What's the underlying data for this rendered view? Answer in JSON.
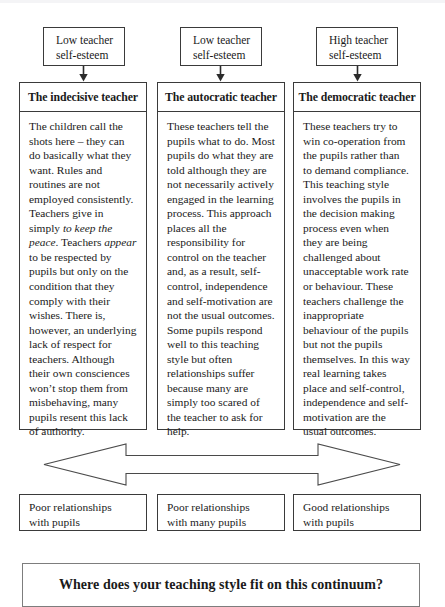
{
  "diagram": {
    "title_banner": "Where does your teaching style fit on this continuum?",
    "esteem_boxes": [
      {
        "line1": "Low teacher",
        "line2": "self-esteem"
      },
      {
        "line1": "Low teacher",
        "line2": "self-esteem"
      },
      {
        "line1": "High teacher",
        "line2": "self-esteem"
      }
    ],
    "columns": [
      {
        "title": "The indecisive teacher",
        "body_html": "The children call the shots here &ndash; they can do basically what they want. Rules and routines are not employed consistently. Teachers give in simply <i>to keep the peace</i>. Teachers <i>appear</i> to be respected by pupils but only on the condition that they comply with their wishes. There is, however, an underlying lack of respect for teachers. Although their own consciences won&rsquo;t stop them from misbehaving, many pupils resent this lack of authority.",
        "body_text": "The children call the shots here – they can do basically what they want. Rules and routines are not employed consistently. Teachers give in simply to keep the peace. Teachers appear to be respected by pupils but only on the condition that they comply with their wishes. There is, however, an underlying lack of respect for teachers. Although their own consciences won’t stop them from misbehaving, many pupils resent this lack of authority."
      },
      {
        "title": "The autocratic teacher",
        "body_html": "These teachers tell the pupils what to do. Most pupils do what they are told although they are not necessarily actively engaged in the learning process. This approach places all the responsibility for control on the teacher and, as a result, self-control, independence and self-motivation are not the usual outcomes. Some pupils respond well to this teaching style but often relationships suffer because many are simply too scared of the teacher to ask for help.",
        "body_text": "These teachers tell the pupils what to do. Most pupils do what they are told although they are not necessarily actively engaged in the learning process. This approach places all the responsibility for control on the teacher and, as a result, self-control, independence and self-motivation are not the usual outcomes. Some pupils respond well to this teaching style but often relationships suffer because many are simply too scared of the teacher to ask for help."
      },
      {
        "title": "The democratic teacher",
        "body_html": "These teachers try to win co-operation from the pupils rather than to demand compliance. This teaching style involves the pupils in the decision making process even when they are being challenged about unacceptable work rate or behaviour. These teachers challenge the inappropriate behaviour of the pupils but not the pupils themselves. In this way real learning takes place and self-control, independence and self-motivation are the usual outcomes.",
        "body_text": "These teachers try to win co-operation from the pupils rather than to demand compliance. This teaching style involves the pupils in the decision making process even when they are being challenged about unacceptable work rate or behaviour. These teachers challenge the inappropriate behaviour of the pupils but not the pupils themselves. In this way real learning takes place and self-control, independence and self-motivation are the usual outcomes."
      }
    ],
    "relationship_boxes": [
      {
        "line1": "Poor relationships",
        "line2": "with pupils"
      },
      {
        "line1": "Poor relationships",
        "line2": "with many pupils"
      },
      {
        "line1": "Good relationships",
        "line2": "with pupils"
      }
    ],
    "icons": {
      "down_arrow": "down-arrow-icon",
      "continuum_arrow": "double-headed-arrow-icon"
    },
    "colors": {
      "stroke": "#3a3a3a",
      "banner_stroke": "#7d7d7d",
      "background": "#ffffff",
      "text": "#1a1a1a"
    }
  }
}
